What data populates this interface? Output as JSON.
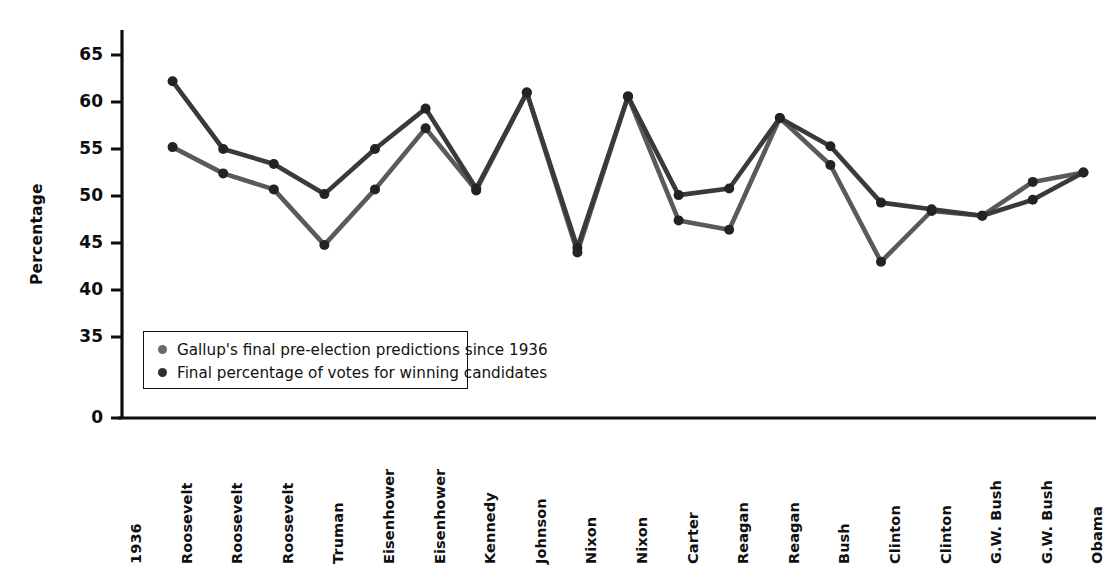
{
  "chart_data": {
    "type": "line",
    "title": "",
    "xlabel": "",
    "ylabel": "Percentage",
    "ylim": [
      0,
      67
    ],
    "y_ticks": [
      0,
      35,
      40,
      45,
      50,
      55,
      60,
      65
    ],
    "axis_break": true,
    "grid": false,
    "legend_position": "inside-lower-left",
    "categories": [
      "1936",
      "Roosevelt",
      "Roosevelt",
      "Roosevelt",
      "Truman",
      "Eisenhower",
      "Eisenhower",
      "Kennedy",
      "Johnson",
      "Nixon",
      "Nixon",
      "Carter",
      "Reagan",
      "Reagan",
      "Bush",
      "Clinton",
      "Clinton",
      "G.W. Bush",
      "G.W. Bush",
      "Obama"
    ],
    "series": [
      {
        "name": "Final percentage of votes for winning candidates",
        "color": "#3a3a3a",
        "values": [
          62.2,
          55.0,
          53.4,
          50.2,
          55.0,
          59.3,
          50.8,
          61.0,
          44.5,
          60.6,
          50.1,
          50.8,
          58.3,
          55.3,
          49.3,
          48.6,
          47.9,
          49.6,
          52.5,
          null
        ]
      },
      {
        "name": "Gallup's final pre-election predictions since 1936",
        "color": "#5a5a5a",
        "values": [
          55.2,
          52.4,
          50.7,
          44.8,
          50.7,
          57.2,
          50.6,
          61.0,
          44.0,
          60.6,
          47.4,
          46.4,
          58.3,
          53.3,
          43.0,
          48.4,
          47.9,
          51.5,
          52.5,
          null
        ]
      }
    ],
    "note": "Two series of 19 plotted points; x positions 1..19 map to election-year labels starting after the 1936 axis label."
  },
  "axis": {
    "y_label": "Percentage",
    "y_tick_labels": [
      "65",
      "60",
      "55",
      "50",
      "45",
      "40",
      "35",
      "0"
    ],
    "x_tick_labels": [
      "1936",
      "Roosevelt",
      "Roosevelt",
      "Roosevelt",
      "Truman",
      "Eisenhower",
      "Eisenhower",
      "Kennedy",
      "Johnson",
      "Nixon",
      "Nixon",
      "Carter",
      "Reagan",
      "Reagan",
      "Bush",
      "Clinton",
      "Clinton",
      "G.W. Bush",
      "G.W. Bush",
      "Obama"
    ]
  },
  "legend": {
    "entries": [
      {
        "label": "Gallup's final pre-election predictions since 1936",
        "color": "#6a6a6a"
      },
      {
        "label": "Final percentage of votes for winning candidates",
        "color": "#2e2e2e"
      }
    ]
  },
  "colors": {
    "axis": "#0d0d0d",
    "series_predictions": "#5e5e5e",
    "series_votes": "#3a3a3a",
    "marker": "#232323",
    "background": "#ffffff"
  }
}
